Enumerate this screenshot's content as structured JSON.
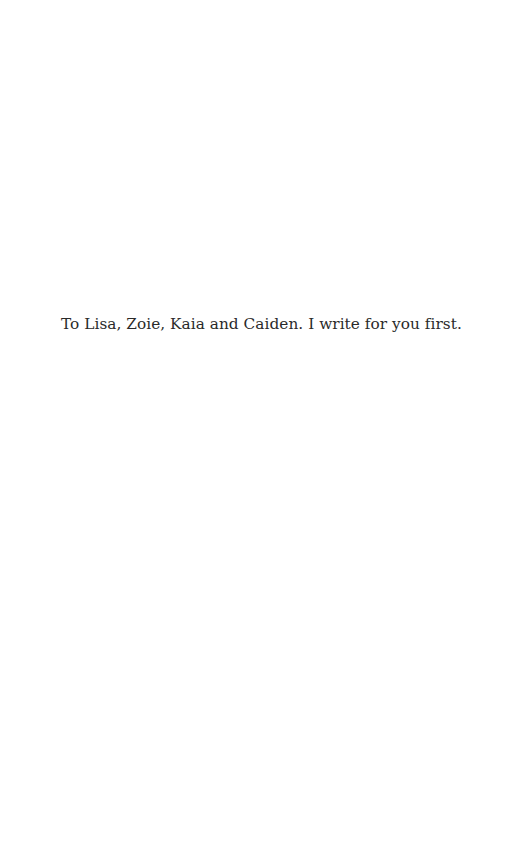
{
  "page": {
    "dedication": "To Lisa, Zoie, Kaia and Caiden. I write for you first."
  }
}
